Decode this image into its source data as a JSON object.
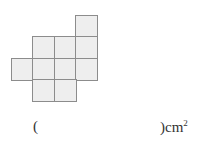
{
  "figure": {
    "cell_color": "#eeeeee",
    "border_color": "#8c8c8c",
    "cells": [
      {
        "row": 0,
        "col": 3
      },
      {
        "row": 1,
        "col": 1
      },
      {
        "row": 1,
        "col": 2
      },
      {
        "row": 1,
        "col": 3
      },
      {
        "row": 2,
        "col": 0
      },
      {
        "row": 2,
        "col": 1
      },
      {
        "row": 2,
        "col": 2
      },
      {
        "row": 2,
        "col": 3
      },
      {
        "row": 3,
        "col": 1
      },
      {
        "row": 3,
        "col": 2
      }
    ]
  },
  "answer": {
    "open_paren": "(",
    "close_paren_unit": ")cm",
    "exponent": "2",
    "value": ""
  }
}
